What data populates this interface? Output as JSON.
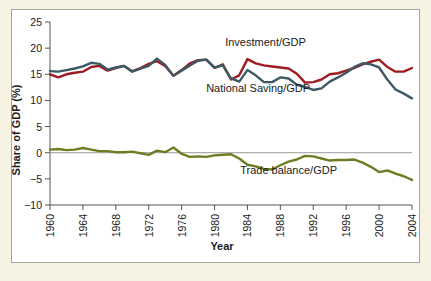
{
  "figure": {
    "background_color": "#f7f3e3",
    "panel_color": "#ffffff",
    "panel_border_color": "#a9a79c"
  },
  "chart_data": {
    "type": "line",
    "title": "",
    "xlabel": "Year",
    "ylabel": "Share of GDP (%)",
    "xlim": [
      1960,
      2004
    ],
    "ylim": [
      -10,
      25
    ],
    "grid": false,
    "legend_position": "inline-annotations",
    "xticks": [
      1960,
      1964,
      1968,
      1972,
      1976,
      1980,
      1984,
      1988,
      1992,
      1996,
      2000,
      2004
    ],
    "xtick_labels": [
      "1960",
      "1964",
      "1968",
      "1972",
      "1976",
      "1980",
      "1984",
      "1988",
      "1992",
      "1996",
      "2000",
      "2004"
    ],
    "yticks": [
      -10,
      -5,
      0,
      5,
      10,
      15,
      20,
      25
    ],
    "ytick_labels": [
      "−10",
      "−5",
      "0",
      "5",
      "10",
      "15",
      "20",
      "25"
    ],
    "zero_line": 0,
    "x": [
      1960,
      1961,
      1962,
      1963,
      1964,
      1965,
      1966,
      1967,
      1968,
      1969,
      1970,
      1971,
      1972,
      1973,
      1974,
      1975,
      1976,
      1977,
      1978,
      1979,
      1980,
      1981,
      1982,
      1983,
      1984,
      1985,
      1986,
      1987,
      1988,
      1989,
      1990,
      1991,
      1992,
      1993,
      1994,
      1995,
      1996,
      1997,
      1998,
      1999,
      2000,
      2001,
      2002,
      2003,
      2004
    ],
    "series": [
      {
        "name": "Investment/GDP",
        "color": "#9e1b22",
        "label_text": "Investment/GDP",
        "label_x": 1986.2,
        "label_y": 20.4,
        "values": [
          15.0,
          14.4,
          15.0,
          15.3,
          15.5,
          16.4,
          16.6,
          15.7,
          16.2,
          16.6,
          15.6,
          16.2,
          17.0,
          17.5,
          16.6,
          14.7,
          15.8,
          17.1,
          17.7,
          17.8,
          16.2,
          16.9,
          14.0,
          14.8,
          17.9,
          17.1,
          16.7,
          16.5,
          16.3,
          16.1,
          15.1,
          13.4,
          13.5,
          14.0,
          15.0,
          15.2,
          15.7,
          16.2,
          16.9,
          17.4,
          17.8,
          16.4,
          15.5,
          15.5,
          16.2
        ]
      },
      {
        "name": "National Saving/GDP",
        "color": "#3b5a66",
        "label_text": "National Saving/GDP",
        "label_x": 1985.3,
        "label_y": 11.6,
        "values": [
          15.6,
          15.5,
          15.8,
          16.1,
          16.5,
          17.2,
          17.0,
          15.9,
          16.3,
          16.6,
          15.5,
          16.1,
          16.6,
          18.0,
          16.8,
          14.7,
          15.7,
          16.7,
          17.6,
          17.8,
          16.3,
          16.7,
          14.2,
          13.6,
          15.8,
          14.8,
          13.5,
          13.5,
          14.4,
          14.2,
          13.0,
          12.6,
          12.0,
          12.3,
          13.6,
          14.4,
          15.3,
          16.4,
          17.1,
          16.9,
          16.3,
          14.0,
          12.1,
          11.3,
          10.4
        ]
      },
      {
        "name": "Trade balance/GDP",
        "color": "#6f7d22",
        "label_text": "Trade balance/GDP",
        "label_x": 1989.0,
        "label_y": -4.0,
        "values": [
          0.6,
          0.7,
          0.5,
          0.6,
          0.9,
          0.6,
          0.3,
          0.3,
          0.1,
          0.1,
          0.2,
          -0.1,
          -0.4,
          0.4,
          0.1,
          1.0,
          -0.2,
          -0.8,
          -0.7,
          -0.8,
          -0.5,
          -0.4,
          -0.3,
          -1.1,
          -2.3,
          -2.6,
          -3.1,
          -3.2,
          -2.4,
          -1.7,
          -1.3,
          -0.6,
          -0.7,
          -1.1,
          -1.5,
          -1.4,
          -1.4,
          -1.3,
          -1.9,
          -2.7,
          -3.7,
          -3.4,
          -4.0,
          -4.5,
          -5.2
        ]
      }
    ]
  }
}
